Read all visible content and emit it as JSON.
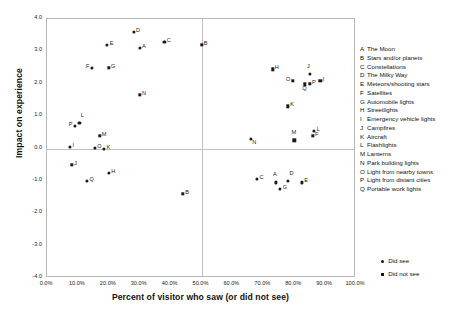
{
  "chart_data": {
    "type": "scatter",
    "title": "",
    "xlabel": "Percent of visitor who saw (or did not see)",
    "ylabel": "Impact on experience",
    "xlim": [
      0,
      100
    ],
    "ylim": [
      -4.0,
      4.0
    ],
    "grid": true,
    "x_ticks": [
      "0.0%",
      "10.0%",
      "20.0%",
      "30.0%",
      "40.0%",
      "50.0%",
      "60.0%",
      "70.0%",
      "80.0%",
      "90.0%",
      "100.0%"
    ],
    "x_tick_values": [
      0,
      10,
      20,
      30,
      40,
      50,
      60,
      70,
      80,
      90,
      100
    ],
    "y_ticks": [
      "4.0",
      "3.0",
      "2.0",
      "1.0",
      "0.0",
      "-1.0",
      "-2.0",
      "-3.0",
      "-4.0"
    ],
    "y_tick_values": [
      4,
      3,
      2,
      1,
      0,
      -1,
      -2,
      -3,
      -4
    ],
    "reference_lines": {
      "horizontal": [
        0.0
      ],
      "vertical": [
        50.0
      ]
    },
    "legend_position": "right",
    "series": [
      {
        "name": "Did see",
        "marker": "circle",
        "color": "#1a1a1a",
        "points": [
          {
            "label": "D",
            "x": 28.0,
            "y": 3.6,
            "pos": "r"
          },
          {
            "label": "C",
            "x": 38.0,
            "y": 3.3,
            "pos": "r"
          },
          {
            "label": "E",
            "x": 19.5,
            "y": 3.2,
            "pos": "r"
          },
          {
            "label": "A",
            "x": 30.0,
            "y": 3.1,
            "pos": "r"
          },
          {
            "label": "F",
            "x": 14.5,
            "y": 2.5,
            "pos": "l"
          },
          {
            "label": "J",
            "x": 85.0,
            "y": 2.3,
            "pos": "t"
          },
          {
            "label": "L",
            "x": 10.5,
            "y": 0.8,
            "pos": "tr"
          },
          {
            "label": "P",
            "x": 9.0,
            "y": 0.7,
            "pos": "l"
          },
          {
            "label": "L",
            "x": 86.5,
            "y": 0.55,
            "pos": "r"
          },
          {
            "label": "N",
            "x": 66.0,
            "y": 0.3,
            "pos": "br"
          },
          {
            "label": "I",
            "x": 7.5,
            "y": 0.05,
            "pos": "r"
          },
          {
            "label": "O",
            "x": 15.5,
            "y": 0.03,
            "pos": "r"
          },
          {
            "label": "K",
            "x": 18.5,
            "y": 0.0,
            "pos": "r"
          },
          {
            "label": "H",
            "x": 20.0,
            "y": -0.75,
            "pos": "r"
          },
          {
            "label": "C",
            "x": 68.0,
            "y": -0.95,
            "pos": "r"
          },
          {
            "label": "Q",
            "x": 13.0,
            "y": -1.0,
            "pos": "r"
          },
          {
            "label": "D",
            "x": 78.0,
            "y": -1.0,
            "pos": "tr"
          },
          {
            "label": "A",
            "x": 74.0,
            "y": -1.05,
            "pos": "t"
          },
          {
            "label": "E",
            "x": 82.5,
            "y": -1.05,
            "pos": "r"
          },
          {
            "label": "G",
            "x": 75.5,
            "y": -1.25,
            "pos": "r"
          }
        ]
      },
      {
        "name": "Did not see",
        "marker": "square",
        "color": "#1a1a1a",
        "points": [
          {
            "label": "B",
            "x": 50.0,
            "y": 3.2,
            "pos": "r"
          },
          {
            "label": "G",
            "x": 20.0,
            "y": 2.5,
            "pos": "r"
          },
          {
            "label": "H",
            "x": 73.0,
            "y": 2.45,
            "pos": "r"
          },
          {
            "label": "O",
            "x": 79.5,
            "y": 2.1,
            "pos": "l"
          },
          {
            "label": "I",
            "x": 88.5,
            "y": 2.1,
            "pos": "r"
          },
          {
            "label": "P",
            "x": 85.0,
            "y": 2.0,
            "pos": "r"
          },
          {
            "label": "Q",
            "x": 83.5,
            "y": 1.98,
            "pos": "b"
          },
          {
            "label": "N",
            "x": 30.0,
            "y": 1.65,
            "pos": "r"
          },
          {
            "label": "K",
            "x": 78.0,
            "y": 1.3,
            "pos": "r"
          },
          {
            "label": "M",
            "x": 17.0,
            "y": 0.4,
            "pos": "r"
          },
          {
            "label": "F",
            "x": 86.0,
            "y": 0.4,
            "pos": "r"
          },
          {
            "label": "M",
            "x": 80.0,
            "y": 0.25,
            "pos": "t"
          },
          {
            "label": "J",
            "x": 8.0,
            "y": -0.5,
            "pos": "r"
          },
          {
            "label": "B",
            "x": 44.0,
            "y": -1.4,
            "pos": "r"
          }
        ]
      }
    ]
  },
  "key": {
    "items": [
      {
        "letter": "A",
        "text": "The Moon"
      },
      {
        "letter": "B",
        "text": "Stars and/or planets"
      },
      {
        "letter": "C",
        "text": "Constellations"
      },
      {
        "letter": "D",
        "text": "The Milky Way"
      },
      {
        "letter": "E",
        "text": "Meteors/shooting stars"
      },
      {
        "letter": "F",
        "text": "Satellites"
      },
      {
        "letter": "G",
        "text": "Automobile lights"
      },
      {
        "letter": "H",
        "text": "Streetlights"
      },
      {
        "letter": "I",
        "text": "Emergency vehicle lights"
      },
      {
        "letter": "J",
        "text": "Campfires"
      },
      {
        "letter": "K",
        "text": "Aircraft"
      },
      {
        "letter": "L",
        "text": "Flashlights"
      },
      {
        "letter": "M",
        "text": "Lanterns"
      },
      {
        "letter": "N",
        "text": "Park building lights"
      },
      {
        "letter": "O",
        "text": "Light from nearby towns"
      },
      {
        "letter": "P",
        "text": "Light from distant cities"
      },
      {
        "letter": "Q",
        "text": "Portable work lights"
      }
    ]
  }
}
